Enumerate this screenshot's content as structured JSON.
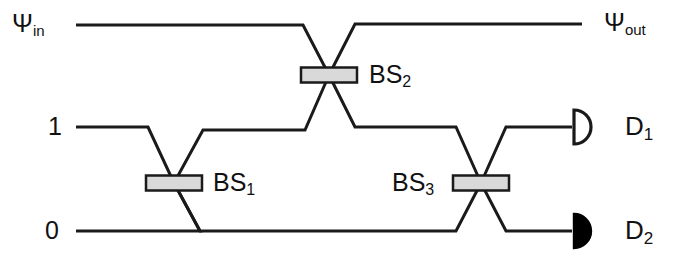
{
  "diagram": {
    "type": "optical-interferometer",
    "stroke_color": "#1a1a1a",
    "beamsplitter_fill": "#d9d9d9",
    "detector_open_fill": "#ffffff",
    "detector_filled_fill": "#000000",
    "background": "#ffffff"
  },
  "labels": {
    "psi_in": {
      "base": "Ψ",
      "sub": "in"
    },
    "psi_out": {
      "base": "Ψ",
      "sub": "out"
    },
    "port_one": "1",
    "port_zero": "0",
    "bs1": {
      "base": "BS",
      "sub": "1"
    },
    "bs2": {
      "base": "BS",
      "sub": "2"
    },
    "bs3": {
      "base": "BS",
      "sub": "3"
    },
    "d1": {
      "base": "D",
      "sub": "1"
    },
    "d2": {
      "base": "D",
      "sub": "2"
    }
  },
  "beamsplitters": [
    {
      "name": "BS1",
      "cx": 174,
      "cy": 183,
      "width": 56,
      "height": 15
    },
    {
      "name": "BS2",
      "cx": 329,
      "cy": 75,
      "width": 56,
      "height": 15
    },
    {
      "name": "BS3",
      "cx": 481,
      "cy": 183,
      "width": 56,
      "height": 15
    }
  ],
  "detectors": [
    {
      "name": "D1",
      "style": "open",
      "cx": 590,
      "cy": 127,
      "radius": 17
    },
    {
      "name": "D2",
      "style": "filled",
      "cx": 590,
      "cy": 231,
      "radius": 17
    }
  ],
  "paths": {
    "psi_in_to_bs2": "M 76,25 L 303,25 L 329,75",
    "bs2_to_psi_out": "M 329,75 L 355,24 L 582,24",
    "port1_to_bs1": "M 76,127 L 148,127 L 174,183",
    "bs1_to_bs2_upper": "M 174,183 L 203,130 L 305,130 L 329,75",
    "bs2_to_bs3_lower": "M 329,75 L 355,127 L 456,127 L 481,183",
    "port0_to_bs1": "M 76,231 L 200,231 L 174,183",
    "bs1_to_bs3_lower": "M 174,183 L 200,231 L 456,231 L 481,183",
    "bs3_to_d1": "M 481,183 L 506,127 L 572,127",
    "bs3_to_d2": "M 481,183 L 506,231 L 572,231"
  }
}
